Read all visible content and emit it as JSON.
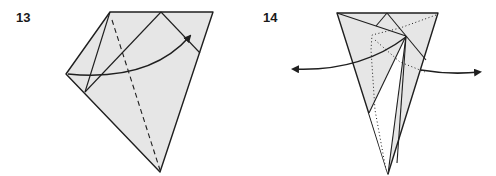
{
  "steps": [
    {
      "number": "13",
      "label_pos": {
        "x": 16,
        "y": 10
      },
      "paper": {
        "fill": "#e6e6e6",
        "outline": [
          [
            110,
            12
          ],
          [
            213,
            12
          ],
          [
            160,
            172
          ],
          [
            66,
            74
          ]
        ]
      },
      "creases": [
        {
          "type": "solid",
          "points": [
            [
              110,
              12
            ],
            [
              85,
              92
            ]
          ]
        },
        {
          "type": "solid",
          "points": [
            [
              161,
              12
            ],
            [
              85,
              92
            ]
          ]
        },
        {
          "type": "solid",
          "points": [
            [
              161,
              12
            ],
            [
              200,
              53
            ]
          ]
        }
      ],
      "valley_folds": [
        {
          "type": "dashed",
          "points": [
            [
              112,
              20
            ],
            [
              160,
              170
            ]
          ]
        }
      ],
      "arrows": [
        {
          "path": "M 68 74 Q 150 82 190 36",
          "head": [
            190,
            36
          ],
          "direction": "up-right"
        }
      ]
    },
    {
      "number": "14",
      "label_pos": {
        "x": 263,
        "y": 10
      },
      "paper": {
        "fill": "#e6e6e6",
        "outline": [
          [
            337,
            13
          ],
          [
            438,
            13
          ],
          [
            388,
            174
          ]
        ]
      },
      "white_region": [
        [
          406,
          36
        ],
        [
          369,
          113
        ],
        [
          388,
          174
        ]
      ],
      "creases": [
        {
          "type": "solid",
          "points": [
            [
              337,
              13
            ],
            [
              406,
              36
            ]
          ]
        },
        {
          "type": "solid",
          "points": [
            [
              387,
              13
            ],
            [
              375,
              25
            ]
          ]
        },
        {
          "type": "solid",
          "points": [
            [
              387,
              13
            ],
            [
              425,
              60
            ]
          ]
        },
        {
          "type": "solid",
          "points": [
            [
              406,
              36
            ],
            [
              369,
              113
            ]
          ]
        },
        {
          "type": "solid",
          "points": [
            [
              406,
              36
            ],
            [
              388,
              174
            ]
          ]
        },
        {
          "type": "solid",
          "points": [
            [
              406,
              36
            ],
            [
              396,
              165
            ]
          ]
        }
      ],
      "hidden_lines": [
        {
          "type": "dotted",
          "points": [
            [
              436,
              15
            ],
            [
              400,
              28
            ],
            [
              372,
              35
            ],
            [
              371,
              50
            ],
            [
              375,
              110
            ],
            [
              386,
              170
            ]
          ]
        },
        {
          "type": "dotted",
          "points": [
            [
              375,
              40
            ],
            [
              400,
              62
            ],
            [
              425,
              72
            ]
          ]
        }
      ],
      "arrows": [
        {
          "path": "M 406 37 Q 360 72 293 69",
          "head": [
            291,
            69
          ],
          "direction": "left"
        },
        {
          "path": "M 421 70 Q 450 75 480 72",
          "head": [
            482,
            72
          ],
          "direction": "right"
        }
      ]
    }
  ],
  "colors": {
    "stroke": "#1f1f1f",
    "paper": "#e6e6e6",
    "background": "#ffffff"
  }
}
